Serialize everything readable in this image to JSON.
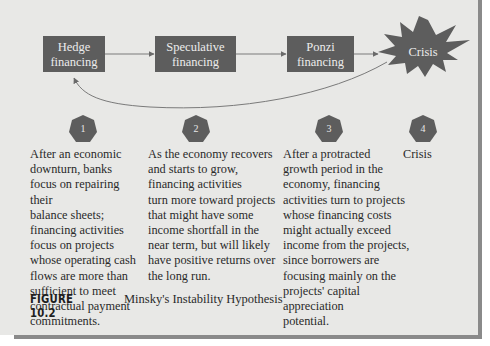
{
  "diagram": {
    "colors": {
      "background": "#e8e8e6",
      "box_fill": "#5d5d5d",
      "box_text": "#ececec",
      "arrow": "#6a6a6a",
      "body_text": "#2a2a2a",
      "frame_shadow": "#8a8a8a"
    },
    "stages": [
      {
        "label_line1": "Hedge",
        "label_line2": "financing"
      },
      {
        "label_line1": "Speculative",
        "label_line2": "financing"
      },
      {
        "label_line1": "Ponzi",
        "label_line2": "financing"
      }
    ],
    "crisis": {
      "label": "Crisis",
      "shape": "starburst"
    },
    "markers": [
      {
        "number": "1",
        "shape": "heptagon"
      },
      {
        "number": "2",
        "shape": "heptagon"
      },
      {
        "number": "3",
        "shape": "heptagon"
      },
      {
        "number": "4",
        "shape": "heptagon"
      }
    ],
    "descriptions": [
      {
        "lines": [
          "After an economic",
          "downturn, banks",
          "focus on repairing their",
          "balance sheets;",
          "financing activities",
          "focus on projects",
          "whose operating cash",
          "flows are more than",
          "sufficient to meet",
          "contractual payment",
          "commitments."
        ]
      },
      {
        "lines": [
          "As the economy recovers",
          "and starts to grow,",
          "financing activities",
          "turn more toward projects",
          "that might have some",
          "income shortfall in the",
          "near term, but will likely",
          "have positive returns over",
          "the long run."
        ]
      },
      {
        "lines": [
          "After a protracted",
          "growth period in the",
          "economy, financing",
          "activities turn to projects",
          "whose financing costs",
          "might actually exceed",
          "income from the projects,",
          "since borrowers are",
          "focusing mainly on the",
          "projects' capital appreciation",
          "potential."
        ]
      },
      {
        "lines": [
          "Crisis"
        ]
      }
    ],
    "caption": {
      "figure_label": "FIGURE 10.2",
      "title": "Minsky's Instability Hypothesis"
    }
  }
}
